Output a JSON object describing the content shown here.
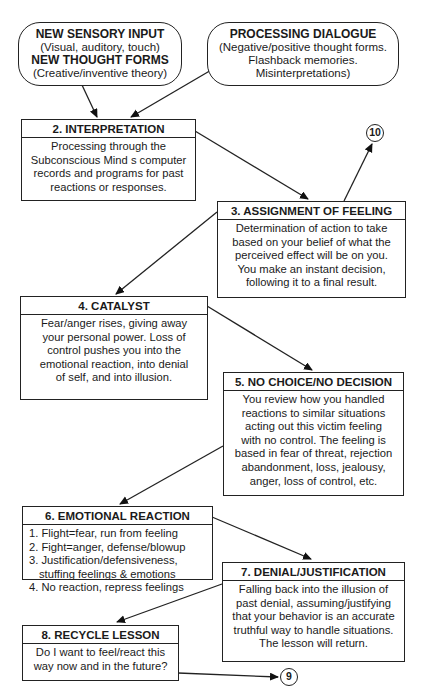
{
  "diagram": {
    "type": "flowchart",
    "inputs": [
      {
        "id": "sensory",
        "lines": [
          {
            "text": "NEW SENSORY INPUT",
            "bold": true
          },
          {
            "text": "(Visual, auditory, touch)",
            "bold": false
          },
          {
            "text": "NEW THOUGHT FORMS",
            "bold": true
          },
          {
            "text": "(Creative/inventive theory)",
            "bold": false
          }
        ]
      },
      {
        "id": "dialogue",
        "lines": [
          {
            "text": "PROCESSING DIALOGUE",
            "bold": true
          },
          {
            "text": "(Negative/positive thought forms.",
            "bold": false
          },
          {
            "text": "Flashback memories.",
            "bold": false
          },
          {
            "text": "Misinterpretations)",
            "bold": false
          }
        ]
      }
    ],
    "steps": [
      {
        "id": 2,
        "title": "2. INTERPRETATION",
        "body": [
          "Processing through the",
          "Subconscious Mind s computer",
          "records and programs for past",
          "reactions or responses."
        ]
      },
      {
        "id": 3,
        "title": "3. ASSIGNMENT OF FEELING",
        "body": [
          "Determination of action to take",
          "based on your belief of what the",
          "perceived effect will be on you.",
          "You make an instant decision,",
          "following it to a final result."
        ]
      },
      {
        "id": 4,
        "title": "4. CATALYST",
        "body": [
          "Fear/anger rises, giving away",
          "your personal power. Loss of",
          "control pushes you into the",
          "emotional reaction, into denial",
          "of self, and into illusion."
        ]
      },
      {
        "id": 5,
        "title": "5. NO CHOICE/NO DECISION",
        "body": [
          "You review how you handled",
          "reactions to similar situations",
          "acting out this victim feeling",
          "with no control. The feeling is",
          "based in fear of threat, rejection",
          "abandonment, loss, jealousy,",
          "anger, loss of control, etc."
        ]
      },
      {
        "id": 6,
        "title": "6. EMOTIONAL REACTION",
        "body": [
          "1. Flight=fear, run from feeling",
          "2. Fight=anger, defense/blowup",
          "3. Justification/defensiveness,",
          "stuffing feelings & emotions",
          "4. No reaction, repress feelings"
        ]
      },
      {
        "id": 7,
        "title": "7. DENIAL/JUSTIFICATION",
        "body": [
          "Falling back into the illusion of",
          "past denial, assuming/justifying",
          "that your behavior is an accurate",
          "truthful way to handle situations.",
          "The lesson will return."
        ]
      },
      {
        "id": 8,
        "title": "8. RECYCLE LESSON",
        "body": [
          "Do I want to feel/react this",
          "way now and in the future?"
        ]
      }
    ],
    "connectors": [
      {
        "id": "10",
        "label": "10"
      },
      {
        "id": "9",
        "label": "9"
      }
    ],
    "edges": [
      {
        "from": "sensory",
        "to": 2
      },
      {
        "from": "dialogue",
        "to": 2
      },
      {
        "from": 2,
        "to": 3
      },
      {
        "from": 3,
        "to": "10"
      },
      {
        "from": 3,
        "to": 4
      },
      {
        "from": 4,
        "to": 5
      },
      {
        "from": 5,
        "to": 6
      },
      {
        "from": 6,
        "to": 7
      },
      {
        "from": 7,
        "to": 8
      },
      {
        "from": 8,
        "to": "9"
      }
    ]
  }
}
